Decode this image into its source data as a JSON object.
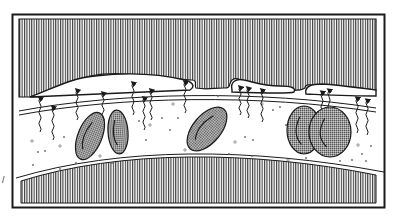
{
  "figure": {
    "colors": {
      "background": "#ffffff",
      "ink": "#1a1a1a",
      "hatch": "#3a3a3a",
      "cell_fill": "#8a8a8a"
    },
    "parts": {
      "upper_tissue": "upper-tissue-hatched",
      "lower_tissue": "lower-tissue-hatched",
      "vessel_wall": "vessel-wall-membrane",
      "red_blood_cells": 6,
      "diffusion_arrows": 15,
      "plasma_particles": 40
    },
    "side_mark": "/"
  }
}
